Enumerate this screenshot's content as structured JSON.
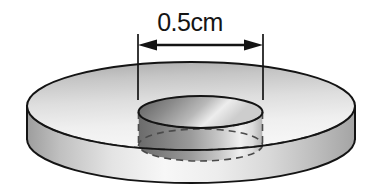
{
  "figure": {
    "name": "annulus-disc-diagram",
    "dimension_label": "0.5cm",
    "dimension_measures": "inner hole diameter",
    "background_color": "#ffffff"
  },
  "geometry": {
    "outer_top_ellipse": {
      "cx": 191,
      "cy": 106,
      "rx": 164,
      "ry": 44
    },
    "outer_bottom_ellipse": {
      "cx": 191,
      "cy": 139,
      "rx": 164,
      "ry": 44
    },
    "inner_top_ellipse": {
      "cx": 200.5,
      "cy": 112,
      "rx": 62,
      "ry": 16
    },
    "inner_bottom_ellipse": {
      "cx": 200.5,
      "cy": 145,
      "rx": 62,
      "ry": 16
    },
    "thickness_px": 33,
    "hidden_back_outer_ellipse": {
      "cx": 191,
      "cy": 106,
      "rx": 164,
      "ry": 44
    },
    "hidden_inner_ellipse": {
      "cx": 200.5,
      "cy": 112,
      "rx": 62,
      "ry": 16
    }
  },
  "dimension": {
    "label": "0.5cm",
    "arrow_line_y": 45,
    "left_extension_x": 138,
    "right_extension_x": 263,
    "extension_top_y": 34,
    "extension_bottom_y": 100,
    "arrow_head_style": "filled-triangle",
    "arrow_heads": 2
  },
  "colors": {
    "outline": "#1a1a1a",
    "hidden_line": "#4f4f4f",
    "top_face_light": "#f2f2f2",
    "top_face_mid": "#d8d8d8",
    "top_face_dark": "#a8a8a8",
    "side_wall_light": "#fbfbfb",
    "side_wall_mid": "#d2d2d2",
    "side_wall_dark": "#9a9a9a",
    "hole_wall_dark": "#5a5a5a",
    "hole_wall_light": "#f0f0f0",
    "text": "#151515"
  }
}
